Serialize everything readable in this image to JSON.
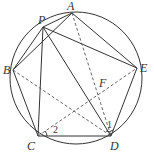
{
  "diagram": {
    "type": "geometry",
    "points": {
      "A": "A",
      "B": "B",
      "C": "C",
      "D": "D",
      "E": "E",
      "P": "P",
      "F": "F"
    },
    "angle_labels": {
      "angle1": "1",
      "angle2": "2"
    },
    "solid_segments": [
      "AB",
      "BC",
      "CD",
      "DE",
      "EA",
      "PA",
      "PB",
      "PC",
      "PD",
      "PE"
    ],
    "dashed_segments": [
      "AD",
      "BD",
      "CE"
    ],
    "colors": {
      "stroke": "#333333",
      "background": "#ffffff"
    }
  }
}
